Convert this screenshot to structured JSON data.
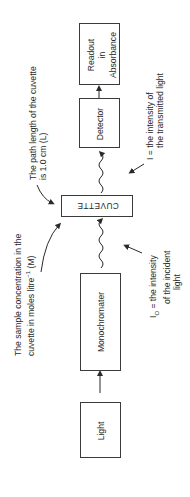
{
  "diagram": {
    "type": "flow",
    "orientation": "rotated-90-ccw",
    "nodes": [
      {
        "id": "light",
        "label": "Light"
      },
      {
        "id": "monochromater",
        "label": "Monochromater"
      },
      {
        "id": "cuvette",
        "label": "CUVETTE"
      },
      {
        "id": "detector",
        "label": "Detector"
      },
      {
        "id": "readout",
        "label_lines": [
          "Readout",
          "in",
          "Absorbance"
        ]
      }
    ],
    "edges": [
      {
        "from": "light",
        "to": "monochromater",
        "style": "straight-arrow"
      },
      {
        "from": "monochromater",
        "to": "cuvette",
        "style": "wavy-arrow"
      },
      {
        "from": "cuvette",
        "to": "detector",
        "style": "wavy-arrow"
      },
      {
        "from": "detector",
        "to": "readout",
        "style": "straight-arrow"
      }
    ],
    "annotations": {
      "path_length": {
        "lines": [
          "The path length of the cuvette",
          "is 1.0 cm (L)"
        ]
      },
      "concentration": {
        "line1": "The sample concentration in the",
        "line2_pre": "cuvette in moles litre",
        "line2_sup": "−1",
        "line2_post": " (M)"
      },
      "transmitted": {
        "lines": [
          "I = the intensity of",
          "the transmitted light"
        ]
      },
      "incident": {
        "line1_pre": "I",
        "line1_sub": "O",
        "line1_post": " = the intensity",
        "line2": "of the incident",
        "line3": "light"
      }
    },
    "colors": {
      "line": "#3a3a3a",
      "text": "#2a2a2a",
      "background": "#ffffff"
    }
  }
}
